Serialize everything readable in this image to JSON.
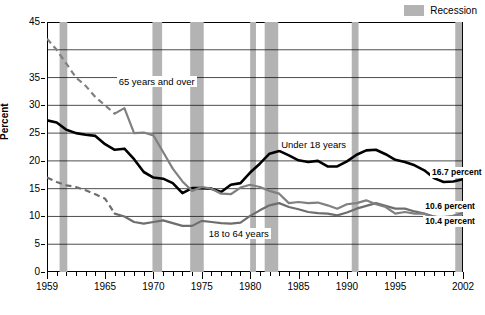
{
  "legend": {
    "recession_label": "Recession",
    "recession_color": "#b3b3b3"
  },
  "axes": {
    "y_title": "Percent",
    "y_ticks": [
      "45",
      "35",
      "30",
      "25",
      "20",
      "15",
      "10",
      "5",
      "0"
    ],
    "y_tick_values": [
      45,
      35,
      30,
      25,
      20,
      15,
      10,
      5,
      0
    ],
    "x_ticks": [
      "1959",
      "1965",
      "1970",
      "1975",
      "1980",
      "1985",
      "1990",
      "1995",
      "2002"
    ],
    "x_tick_values": [
      1959,
      1965,
      1970,
      1975,
      1980,
      1985,
      1990,
      1995,
      2002
    ]
  },
  "annotations": {
    "over65": "65 years and over",
    "under18": "Under 18 years",
    "adults": "18 to 64 years",
    "end_under18": "16.7 percent",
    "end_adults": "10.6 percent",
    "end_over65": "10.4 percent"
  },
  "chart_data": {
    "type": "line",
    "title": "",
    "xlabel": "",
    "ylabel": "Percent",
    "xlim": [
      1959,
      2002
    ],
    "ylim": [
      0,
      45
    ],
    "grid": true,
    "legend_position": "top-right",
    "x": [
      1959,
      1960,
      1961,
      1962,
      1963,
      1964,
      1965,
      1966,
      1967,
      1968,
      1969,
      1970,
      1971,
      1972,
      1973,
      1974,
      1975,
      1976,
      1977,
      1978,
      1979,
      1980,
      1981,
      1982,
      1983,
      1984,
      1985,
      1986,
      1987,
      1988,
      1989,
      1990,
      1991,
      1992,
      1993,
      1994,
      1995,
      1996,
      1997,
      1998,
      1999,
      2000,
      2001,
      2002
    ],
    "series": [
      {
        "name": "Under 18 years",
        "color": "#000000",
        "width": 2.6,
        "end_label": "16.7 percent",
        "values": [
          27.3,
          26.9,
          25.6,
          25.0,
          24.7,
          24.5,
          23.0,
          22.0,
          22.2,
          20.3,
          18.0,
          17.0,
          16.8,
          16.0,
          14.2,
          15.1,
          15.1,
          15.0,
          14.4,
          15.7,
          16.0,
          17.9,
          19.5,
          21.3,
          21.8,
          21.0,
          20.1,
          19.8,
          20.0,
          19.0,
          19.0,
          19.9,
          21.1,
          21.9,
          22.0,
          21.2,
          20.2,
          19.8,
          19.2,
          18.3,
          16.9,
          16.2,
          16.3,
          16.7
        ]
      },
      {
        "name": "18 to 64 years",
        "color": "#6e6e6e",
        "width": 2.2,
        "end_label": "10.6 percent",
        "dashed_start": true,
        "dashed_x": [
          1959,
          1960,
          1961,
          1962,
          1963,
          1964,
          1965,
          1966
        ],
        "values": [
          17.0,
          16.2,
          15.6,
          15.3,
          14.7,
          14.0,
          13.2,
          10.5,
          10.0,
          9.0,
          8.7,
          9.0,
          9.3,
          8.8,
          8.3,
          8.3,
          9.2,
          9.0,
          8.8,
          8.7,
          8.9,
          10.1,
          11.1,
          12.0,
          12.4,
          11.7,
          11.3,
          10.8,
          10.6,
          10.5,
          10.2,
          10.7,
          11.4,
          11.9,
          12.4,
          11.9,
          11.4,
          11.4,
          10.9,
          10.5,
          10.0,
          9.6,
          10.1,
          10.6
        ]
      },
      {
        "name": "65 years and over",
        "color": "#808080",
        "width": 2.2,
        "end_label": "10.4 percent",
        "dashed_start": true,
        "dashed_x": [
          1959,
          1960,
          1961,
          1962,
          1963,
          1964,
          1965,
          1966
        ],
        "values": [
          42.0,
          40.0,
          37.5,
          35.0,
          33.5,
          31.5,
          30.0,
          28.5,
          29.5,
          25.0,
          25.1,
          24.6,
          21.6,
          18.6,
          16.3,
          14.6,
          15.3,
          15.0,
          14.1,
          14.0,
          15.2,
          15.7,
          15.3,
          14.6,
          14.1,
          12.4,
          12.6,
          12.4,
          12.5,
          12.0,
          11.4,
          12.2,
          12.4,
          12.9,
          12.2,
          11.7,
          10.5,
          10.8,
          10.5,
          10.5,
          9.7,
          9.9,
          10.1,
          10.4
        ]
      }
    ],
    "recessions": [
      {
        "start": 1960.3,
        "end": 1961.1
      },
      {
        "start": 1969.9,
        "end": 1970.9
      },
      {
        "start": 1973.8,
        "end": 1975.2
      },
      {
        "start": 1980.0,
        "end": 1980.6
      },
      {
        "start": 1981.5,
        "end": 1982.9
      },
      {
        "start": 1990.5,
        "end": 1991.2
      },
      {
        "start": 2001.2,
        "end": 2001.9
      }
    ]
  }
}
